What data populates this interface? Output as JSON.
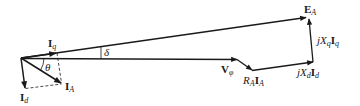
{
  "diagram": {
    "type": "phasor-diagram",
    "colors": {
      "line": "#1a1a1a",
      "background": "#ffffff"
    },
    "phasors": [
      {
        "id": "EA",
        "label_main": "E",
        "label_sub": "A"
      },
      {
        "id": "Vphi",
        "label_main": "V",
        "label_sub": "φ"
      },
      {
        "id": "Iq",
        "label_main": "I",
        "label_sub": "q"
      },
      {
        "id": "Id",
        "label_main": "I",
        "label_sub": "d"
      },
      {
        "id": "IA",
        "label_main": "I",
        "label_sub": "A"
      },
      {
        "id": "RAIA",
        "label_pre": "R",
        "label_pre_sub": "A",
        "label_main": "I",
        "label_sub": "A"
      },
      {
        "id": "jXdId",
        "label_pre": "jX",
        "label_pre_sub": "d",
        "label_main": "I",
        "label_sub": "d"
      },
      {
        "id": "jXqIq",
        "label_pre": "jX",
        "label_pre_sub": "q",
        "label_main": "I",
        "label_sub": "q"
      }
    ],
    "angles": [
      {
        "id": "delta",
        "label": "δ"
      },
      {
        "id": "theta",
        "label": "θ"
      }
    ]
  }
}
